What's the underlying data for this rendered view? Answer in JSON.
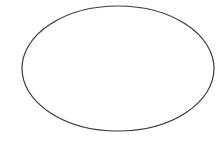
{
  "diagram": {
    "background": "#ffffff",
    "shapes": [
      {
        "type": "ellipse",
        "cx": 118,
        "cy": 68.5,
        "rx": 96,
        "ry": 62.5,
        "fill": "none",
        "stroke": "#3a3a3a",
        "stroke_width": 1.2
      }
    ]
  }
}
